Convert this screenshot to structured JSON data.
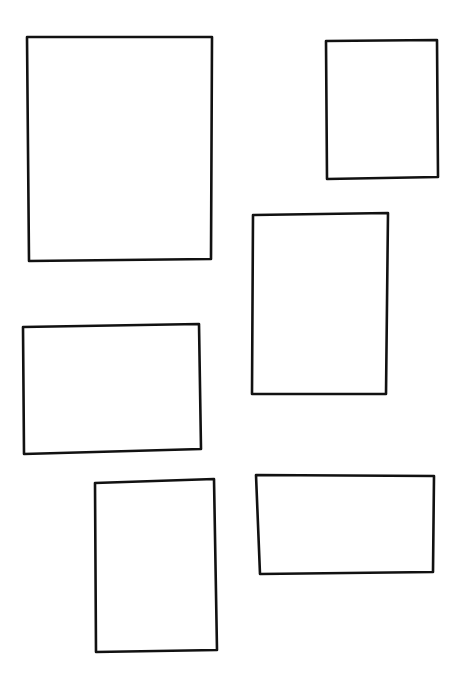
{
  "canvas": {
    "width": 462,
    "height": 687,
    "background": "#ffffff",
    "stroke_color": "#111111",
    "stroke_width": 2.6
  },
  "shapes": [
    {
      "id": "box-1",
      "type": "rectangle",
      "label": "",
      "points": [
        [
          27,
          37
        ],
        [
          212,
          37
        ],
        [
          211,
          259
        ],
        [
          29,
          261
        ]
      ]
    },
    {
      "id": "box-2",
      "type": "rectangle",
      "label": "",
      "points": [
        [
          326,
          41
        ],
        [
          437,
          40
        ],
        [
          438,
          177
        ],
        [
          327,
          179
        ]
      ]
    },
    {
      "id": "box-3",
      "type": "rectangle",
      "label": "",
      "points": [
        [
          253,
          215
        ],
        [
          388,
          213
        ],
        [
          386,
          394
        ],
        [
          252,
          394
        ]
      ]
    },
    {
      "id": "box-4",
      "type": "rectangle",
      "label": "",
      "points": [
        [
          23,
          327
        ],
        [
          199,
          324
        ],
        [
          201,
          449
        ],
        [
          24,
          454
        ]
      ]
    },
    {
      "id": "box-5",
      "type": "rectangle",
      "label": "",
      "points": [
        [
          95,
          483
        ],
        [
          214,
          479
        ],
        [
          217,
          650
        ],
        [
          96,
          652
        ]
      ]
    },
    {
      "id": "box-6",
      "type": "rectangle",
      "label": "",
      "points": [
        [
          256,
          475
        ],
        [
          434,
          476
        ],
        [
          433,
          572
        ],
        [
          260,
          574
        ]
      ]
    }
  ]
}
